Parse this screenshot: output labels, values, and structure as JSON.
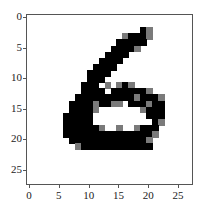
{
  "chart_data": {
    "type": "heatmap",
    "title": "",
    "xlabel": "",
    "ylabel": "",
    "colormap": "gray_r",
    "size": [
      28,
      28
    ],
    "xlim": [
      -0.5,
      27.5
    ],
    "ylim": [
      27.5,
      -0.5
    ],
    "x_ticks": [
      0,
      5,
      10,
      15,
      20,
      25
    ],
    "y_ticks": [
      0,
      5,
      10,
      15,
      20,
      25
    ],
    "rows": [
      "............................",
      "............................",
      "...................#+.......",
      "................+###+.......",
      "...............#####........",
      "..............####+.........",
      ".............####...........",
      "............####............",
      "...........####.............",
      "..........####..............",
      "..........###...............",
      ".........###.+.+#+..........",
      ".........####.######+.......",
      "........##########+###+.....",
      ".......####+##++.###+##.....",
      ".......####+.......+###.....",
      "......#####.........###.....",
      "......#####..........#+.....",
      "......######+..+..+###......",
      "......###############+......",
      ".......#############+.......",
      "........+############.......",
      "............................",
      "............................",
      "............................",
      "............................",
      "............................",
      "............................"
    ]
  },
  "axes": {
    "y_labels": [
      "0",
      "5",
      "10",
      "15",
      "20",
      "25"
    ],
    "x_labels": [
      "0",
      "5",
      "10",
      "15",
      "20",
      "25"
    ]
  },
  "colors": {
    "ink": "#000000",
    "mid": "#7a7a7a",
    "background": "#ffffff",
    "frame": "#555555"
  }
}
